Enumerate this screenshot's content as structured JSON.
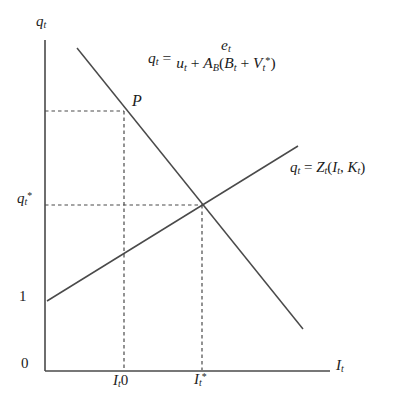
{
  "figure": {
    "background_color": "#ffffff",
    "line_color": "#4a4a4a",
    "text_color": "#1b1b1b"
  },
  "axes": {
    "y_axis_label_parts": [
      {
        "text": "q",
        "style": "i"
      },
      {
        "text": "t",
        "style": "sub"
      }
    ],
    "x_axis_label_parts": [
      {
        "text": "I",
        "style": "i"
      },
      {
        "text": "t",
        "style": "sub"
      }
    ],
    "origin_label": "0",
    "y_tick_one_label": "1",
    "y_tick_qstar_parts": [
      {
        "text": "q",
        "style": "i"
      },
      {
        "text": "t",
        "style": "sub"
      },
      {
        "text": "*",
        "style": "sup"
      }
    ],
    "x_tick_i0_parts": [
      {
        "text": "I",
        "style": "i"
      },
      {
        "text": "t",
        "style": "sub"
      },
      {
        "text": "0",
        "style": "n"
      }
    ],
    "x_tick_istar_parts": [
      {
        "text": "I",
        "style": "i"
      },
      {
        "text": "t",
        "style": "sub"
      },
      {
        "text": "*",
        "style": "sup"
      }
    ]
  },
  "demand_curve": {
    "point_label": "P",
    "equation": {
      "lhs_parts": [
        {
          "text": "q",
          "style": "i"
        },
        {
          "text": "t",
          "style": "sub"
        },
        {
          "text": " =",
          "style": "n"
        }
      ],
      "numerator_parts": [
        {
          "text": "e",
          "style": "i"
        },
        {
          "text": "t",
          "style": "sub"
        }
      ],
      "denominator_parts": [
        {
          "text": "u",
          "style": "i"
        },
        {
          "text": "t",
          "style": "sub"
        },
        {
          "text": " + ",
          "style": "n"
        },
        {
          "text": "A",
          "style": "i"
        },
        {
          "text": "B",
          "style": "sub"
        },
        {
          "text": "(",
          "style": "n"
        },
        {
          "text": "B",
          "style": "i"
        },
        {
          "text": "t",
          "style": "sub"
        },
        {
          "text": " + ",
          "style": "n"
        },
        {
          "text": "V",
          "style": "i"
        },
        {
          "text": "t",
          "style": "sub"
        },
        {
          "text": "*",
          "style": "sup"
        },
        {
          "text": ")",
          "style": "n"
        }
      ]
    }
  },
  "supply_curve": {
    "label_parts": [
      {
        "text": "q",
        "style": "i"
      },
      {
        "text": "t",
        "style": "sub"
      },
      {
        "text": " = ",
        "style": "n"
      },
      {
        "text": "Z",
        "style": "i"
      },
      {
        "text": "t",
        "style": "sub"
      },
      {
        "text": "(",
        "style": "n"
      },
      {
        "text": "I",
        "style": "i"
      },
      {
        "text": "t",
        "style": "sub"
      },
      {
        "text": ", ",
        "style": "n"
      },
      {
        "text": "K",
        "style": "i"
      },
      {
        "text": "t",
        "style": "sub"
      },
      {
        "text": ")",
        "style": "n"
      }
    ]
  },
  "chart_data": {
    "type": "line",
    "title": "",
    "xlabel": "I_t",
    "ylabel": "q_t",
    "x_tick_labels": [
      "0",
      "I_t0",
      "I_t*"
    ],
    "y_tick_labels": [
      "0",
      "1",
      "q_t*"
    ],
    "grid": false,
    "legend_position": "labels-on-curves",
    "series": [
      {
        "name": "q_t = e_t / (u_t + A_B(B_t + V_t*))",
        "slope": "negative",
        "points_fraction_of_axes": [
          [
            0.11,
            0.98
          ],
          [
            0.9,
            0.13
          ]
        ]
      },
      {
        "name": "q_t = Z_t(I_t, K_t)",
        "slope": "positive",
        "y_intercept_label": "1",
        "points_fraction_of_axes": [
          [
            0.01,
            0.21
          ],
          [
            0.89,
            0.68
          ]
        ]
      }
    ],
    "annotations": [
      {
        "label": "P",
        "position_fraction": [
          0.28,
          0.79
        ],
        "description": "point on demand curve above I_t0"
      },
      {
        "label": "equilibrium",
        "position_fraction": [
          0.55,
          0.5
        ],
        "description": "curves intersect at (I_t*, q_t*)"
      }
    ],
    "dashed_guides": [
      "horizontal from q-axis to point P",
      "vertical from point P down to I_t0",
      "horizontal from q_t* to equilibrium point",
      "vertical from equilibrium point down to I_t*"
    ]
  }
}
